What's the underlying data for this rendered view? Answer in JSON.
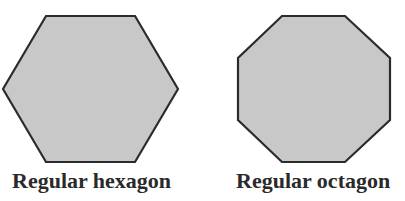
{
  "figure": {
    "shapes": [
      {
        "name": "hexagon",
        "label": "Regular hexagon",
        "sides": 6
      },
      {
        "name": "octagon",
        "label": "Regular octagon",
        "sides": 8
      }
    ],
    "colors": {
      "fill": "#c8c8c8",
      "stroke": "#2b2b2b",
      "background": "#ffffff"
    }
  }
}
